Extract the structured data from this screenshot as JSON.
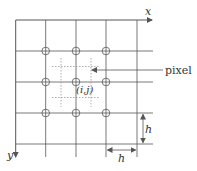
{
  "diagram": {
    "type": "pixel-grid",
    "colors": {
      "line": "#555555",
      "dotted": "#9a9a9a",
      "text": "#333333",
      "background": "#ffffff"
    },
    "axes": {
      "x_label": "x",
      "y_label": "y"
    },
    "grid": {
      "vertical_lines_x": [
        45.7,
        76,
        106,
        137
      ],
      "horizontal_lines_y": [
        51,
        82,
        113,
        144
      ],
      "sample_points": [
        {
          "x": 45.7,
          "y": 51
        },
        {
          "x": 76,
          "y": 51
        },
        {
          "x": 106,
          "y": 51
        },
        {
          "x": 45.7,
          "y": 82
        },
        {
          "x": 76,
          "y": 82
        },
        {
          "x": 106,
          "y": 82
        },
        {
          "x": 45.7,
          "y": 113
        },
        {
          "x": 76,
          "y": 113
        },
        {
          "x": 106,
          "y": 113
        }
      ]
    },
    "center_label": "(i,j)",
    "pixel_label": "pixel",
    "spacing_label_horizontal": "h",
    "spacing_label_vertical": "h"
  }
}
